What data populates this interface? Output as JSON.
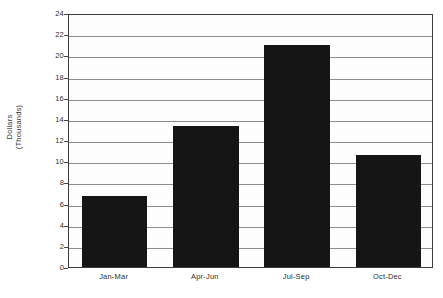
{
  "chart_data": {
    "type": "bar",
    "title": "",
    "xlabel": "",
    "ylabel": "Dollars\n(Thousands)",
    "categories": [
      "Jan-Mar",
      "Apr-Jun",
      "Jul-Sep",
      "Oct-Dec"
    ],
    "values": [
      6.7,
      13.3,
      21.0,
      10.6
    ],
    "ylim": [
      0,
      24
    ],
    "ytick_step": 2,
    "yticks": [
      0,
      2,
      4,
      6,
      8,
      10,
      12,
      14,
      16,
      18,
      20,
      22,
      24
    ],
    "ytick_labels": [
      "0",
      "2",
      "4",
      "6",
      "8",
      "10",
      "12",
      "14",
      "16",
      "18",
      "20",
      "22",
      "24"
    ],
    "grid": true,
    "grid_axis": "y",
    "legend": false,
    "legend_position": "none",
    "bar_color": "#151515",
    "grid_color": "#8c8c8c",
    "frame_color": "#3d3d3d",
    "background_color": "#fdfdfd"
  }
}
